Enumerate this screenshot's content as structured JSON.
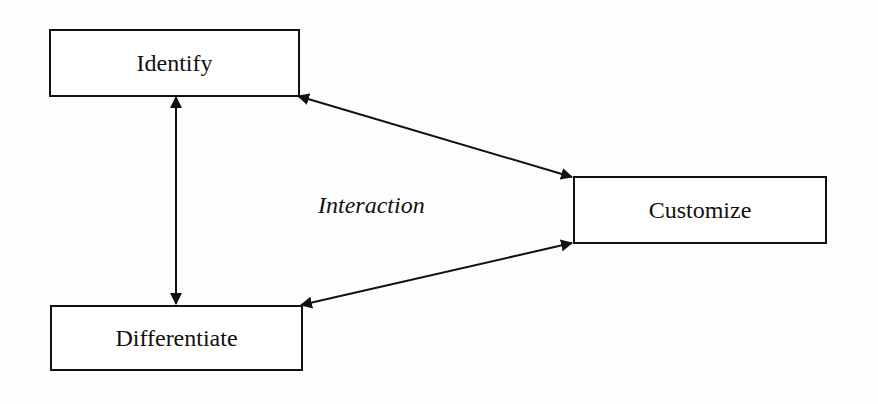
{
  "diagram": {
    "nodes": [
      {
        "id": "identify",
        "label": "Identify"
      },
      {
        "id": "differentiate",
        "label": "Differentiate"
      },
      {
        "id": "customize",
        "label": "Customize"
      }
    ],
    "edges": [
      {
        "from": "identify",
        "to": "differentiate",
        "bidirectional": true
      },
      {
        "from": "identify",
        "to": "customize",
        "bidirectional": true
      },
      {
        "from": "differentiate",
        "to": "customize",
        "bidirectional": true
      }
    ],
    "center_label": "Interaction"
  }
}
